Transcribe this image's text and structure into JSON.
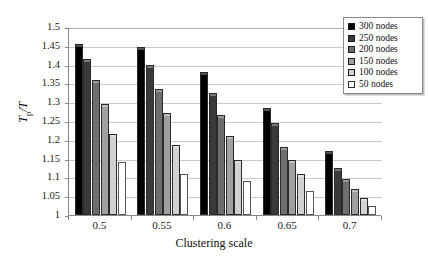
{
  "chart_data": {
    "type": "bar",
    "title": "",
    "xlabel": "Clustering scale",
    "ylabel": "Tp/T",
    "ylabel_base": "T",
    "ylabel_sub": "p",
    "ylabel_denom": "/T",
    "categories": [
      "0.5",
      "0.55",
      "0.6",
      "0.65",
      "0.7"
    ],
    "ylim": [
      1,
      1.5
    ],
    "ytick_labels": [
      "1",
      "1.05",
      "1.1",
      "1.15",
      "1.2",
      "1.25",
      "1.3",
      "1.35",
      "1.4",
      "1.45",
      "1.5"
    ],
    "ytick_values": [
      1,
      1.05,
      1.1,
      1.15,
      1.2,
      1.25,
      1.3,
      1.35,
      1.4,
      1.45,
      1.5
    ],
    "grid": true,
    "legend_position": "top-right",
    "series": [
      {
        "name": "300 nodes",
        "color": "#000000",
        "values": [
          1.455,
          1.448,
          1.38,
          1.285,
          1.17
        ]
      },
      {
        "name": "250 nodes",
        "color": "#3a3a3a",
        "values": [
          1.415,
          1.398,
          1.325,
          1.245,
          1.125
        ]
      },
      {
        "name": "200 nodes",
        "color": "#6e6e6e",
        "values": [
          1.36,
          1.335,
          1.265,
          1.18,
          1.095
        ]
      },
      {
        "name": "150 nodes",
        "color": "#a0a0a0",
        "values": [
          1.295,
          1.27,
          1.21,
          1.145,
          1.07
        ]
      },
      {
        "name": "100 nodes",
        "color": "#d2d2d2",
        "values": [
          1.215,
          1.185,
          1.145,
          1.11,
          1.045
        ]
      },
      {
        "name": "50 nodes",
        "color": "#ffffff",
        "values": [
          1.14,
          1.11,
          1.09,
          1.065,
          1.025
        ]
      }
    ]
  },
  "legend": {
    "items": [
      {
        "label": "300 nodes"
      },
      {
        "label": "250 nodes"
      },
      {
        "label": "200 nodes"
      },
      {
        "label": "150 nodes"
      },
      {
        "label": "100 nodes"
      },
      {
        "label": "50 nodes"
      }
    ]
  }
}
